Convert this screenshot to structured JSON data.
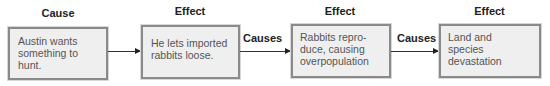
{
  "diagram": {
    "type": "cause-effect-flowchart",
    "nodes": [
      {
        "heading": "Cause",
        "text": "Austin wants something to hunt."
      },
      {
        "heading": "Effect",
        "text": "He lets imported rabbits loose."
      },
      {
        "heading": "Effect",
        "text": "Rabbits repro-duce, causing overpopulation"
      },
      {
        "heading": "Effect",
        "text": "Land and species devastation"
      }
    ],
    "edges": [
      {
        "from": 0,
        "to": 1,
        "label": ""
      },
      {
        "from": 1,
        "to": 2,
        "label": "Causes"
      },
      {
        "from": 2,
        "to": 3,
        "label": "Causes"
      }
    ]
  }
}
